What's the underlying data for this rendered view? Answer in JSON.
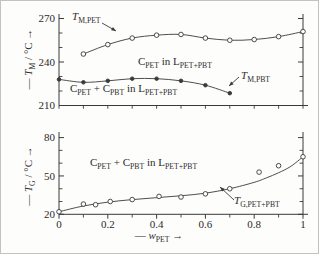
{
  "figure": {
    "ink_color": "#3a3a3a",
    "text_color": "#2b2b2b",
    "background": "#fdfdfc"
  },
  "chart_data": [
    {
      "type": "line",
      "panel": "top",
      "ylabel": "— T_{M} / °C →",
      "xlabel": "",
      "ylim": [
        210,
        270
      ],
      "xlim": [
        0,
        1
      ],
      "yticks": [
        210,
        240,
        270
      ],
      "ytick_labels": [
        "210",
        "240",
        "270"
      ],
      "yminor": [
        220,
        230,
        250,
        260
      ],
      "xminor_step": 0.1,
      "grid": false,
      "series": [
        {
          "name": "T_{M,PET}",
          "marker": "open-circle",
          "x": [
            0.1,
            0.2,
            0.3,
            0.4,
            0.5,
            0.6,
            0.7,
            0.8,
            0.9,
            1.0
          ],
          "y": [
            245.5,
            252,
            256.5,
            258.5,
            259,
            256.5,
            255,
            255.5,
            257.5,
            261
          ]
        },
        {
          "name": "T_{M,PBT}",
          "marker": "filled-circle",
          "x": [
            0,
            0.1,
            0.2,
            0.3,
            0.4,
            0.5,
            0.6,
            0.7
          ],
          "y": [
            228,
            226,
            227,
            228.5,
            228.5,
            227,
            224,
            218.5
          ]
        }
      ],
      "annotations": {
        "tm_pet": "T_{M,PET}",
        "cpet_in_l": "C_{PET} in L_{PET+PBT}",
        "mix_in_l": "C_{PET} + C_{PBT} in L_{PET+PBT}",
        "tm_pbt": "T_{M,PBT}"
      }
    },
    {
      "type": "scatter",
      "panel": "bottom",
      "ylabel": "— T_{G} / °C →",
      "xlabel": "— w_{PET} →",
      "ylim": [
        20,
        80
      ],
      "xlim": [
        0,
        1
      ],
      "yticks": [
        20,
        50,
        80
      ],
      "ytick_labels": [
        "20",
        "50",
        "80"
      ],
      "yminor": [
        30,
        40,
        60,
        70
      ],
      "xticks": [
        0,
        0.2,
        0.4,
        0.6,
        0.8,
        1
      ],
      "xtick_labels": [
        "0",
        "0.2",
        "0.4",
        "0.6",
        "0.8",
        "1"
      ],
      "xminor": [
        0.1,
        0.3,
        0.5,
        0.7,
        0.9
      ],
      "grid": false,
      "series": [
        {
          "name": "T_{G,PET+PBT}",
          "marker": "open-circle",
          "x": [
            0,
            0.1,
            0.15,
            0.21,
            0.3,
            0.41,
            0.5,
            0.6,
            0.7,
            0.82,
            0.9,
            1.0
          ],
          "y": [
            22,
            28,
            27.5,
            30,
            31.5,
            34,
            33.5,
            36,
            40,
            53,
            58,
            65
          ],
          "fit_x": [
            0,
            0.1,
            0.2,
            0.3,
            0.4,
            0.5,
            0.6,
            0.7,
            0.8,
            0.85,
            0.9,
            0.95,
            1
          ],
          "fit_y": [
            22,
            26.5,
            29.5,
            31.5,
            33,
            34.5,
            36.5,
            40,
            45,
            48.5,
            52.5,
            57.5,
            65
          ]
        }
      ],
      "annotations": {
        "mix_in_l": "C_{PET} + C_{PBT} in L_{PET+PBT}",
        "tg": "T_{G,PET+PBT}"
      }
    }
  ]
}
